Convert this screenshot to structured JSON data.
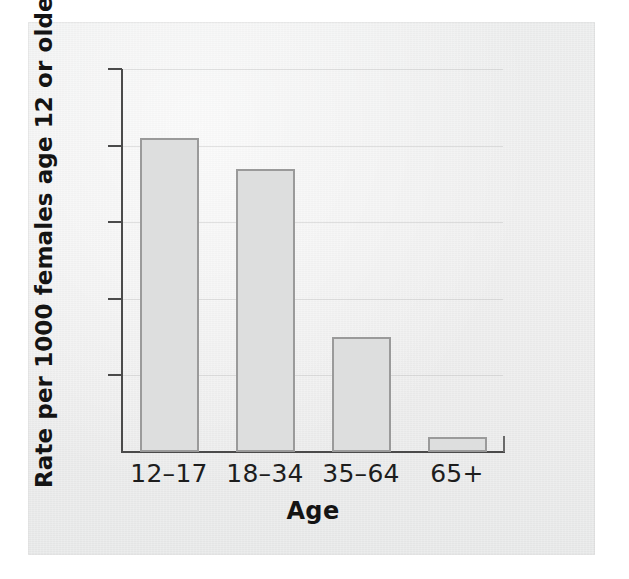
{
  "figure": {
    "panel_background": "#ececec",
    "page_background": "#ffffff"
  },
  "chart_data": {
    "type": "bar",
    "title": "",
    "subtitle": "",
    "xlabel": "Age",
    "ylabel": "Rate per 1000 females age 12 or older",
    "categories": [
      "12–17",
      "18–34",
      "35–64",
      "65+"
    ],
    "values": [
      4.1,
      3.7,
      1.5,
      0.2
    ],
    "ylim": [
      0,
      5
    ],
    "yticks": [
      0,
      1,
      2,
      3,
      4,
      5
    ],
    "ytick_labels": [
      "0",
      "1",
      "2",
      "3",
      "4",
      "5"
    ],
    "xtick_labels": [
      "12–17",
      "18–34",
      "35–64",
      "65+"
    ],
    "grid": true,
    "legend": false,
    "legend_position": "none",
    "bar_fill_color": "#dddede",
    "bar_edge_color": "#9a9a9a",
    "axis_color": "#4a4a4a",
    "series": [
      {
        "name": "Rate per 1000 females age 12 or older",
        "values": [
          4.1,
          3.7,
          1.5,
          0.2
        ]
      }
    ]
  }
}
